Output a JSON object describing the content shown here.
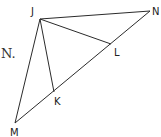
{
  "diagram": {
    "type": "geometry-figure",
    "text_fragment": "N.",
    "vertices": [
      {
        "id": "J",
        "label": "J"
      },
      {
        "id": "N",
        "label": "N"
      },
      {
        "id": "M",
        "label": "M"
      },
      {
        "id": "K",
        "label": "K"
      },
      {
        "id": "L",
        "label": "L"
      }
    ],
    "segments": [
      {
        "from": "J",
        "to": "N"
      },
      {
        "from": "J",
        "to": "M"
      },
      {
        "from": "M",
        "to": "N"
      },
      {
        "from": "J",
        "to": "K"
      },
      {
        "from": "J",
        "to": "L"
      }
    ],
    "line_color": "#2b2b2b",
    "label_color": "#222222"
  }
}
